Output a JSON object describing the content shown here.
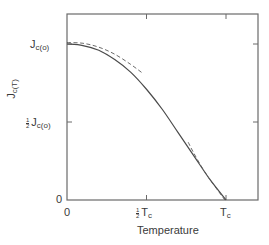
{
  "chart_data": {
    "type": "line",
    "title": "",
    "xlabel": "Temperature",
    "ylabel": "Jc(T)",
    "x_ticks": [
      {
        "label": "0",
        "value": 0
      },
      {
        "label": "½ Tc",
        "value": 0.5
      },
      {
        "label": "Tc",
        "value": 1.0
      }
    ],
    "y_ticks": [
      {
        "label": "0",
        "value": 0
      },
      {
        "label": "½ Jc(o)",
        "value": 0.5
      },
      {
        "label": "Jc(o)",
        "value": 1.0
      }
    ],
    "xlim": [
      0,
      1.2
    ],
    "ylim": [
      0,
      1.2
    ],
    "grid": false,
    "legend": null,
    "series": [
      {
        "name": "Jc(T) (solid)",
        "style": "solid",
        "x": [
          0.0,
          0.1,
          0.2,
          0.3,
          0.4,
          0.5,
          0.6,
          0.7,
          0.8,
          0.9,
          1.0
        ],
        "y": [
          1.0,
          0.99,
          0.96,
          0.9,
          0.82,
          0.71,
          0.58,
          0.43,
          0.28,
          0.13,
          0.0
        ]
      },
      {
        "name": "low-temperature approximation (dashed)",
        "style": "dashed",
        "x": [
          0.0,
          0.1,
          0.2,
          0.3,
          0.4,
          0.48
        ],
        "y": [
          1.0,
          0.995,
          0.97,
          0.925,
          0.86,
          0.8
        ]
      },
      {
        "name": "near-Tc approximation (dashed)",
        "style": "dashed",
        "x": [
          0.77,
          0.8,
          0.85,
          0.9,
          0.95,
          1.0
        ],
        "y": [
          0.37,
          0.31,
          0.22,
          0.14,
          0.07,
          0.0
        ]
      }
    ]
  },
  "labels": {
    "y_top": {
      "main": "J",
      "sub": "c(o)"
    },
    "y_half": {
      "num": "1",
      "den": "2",
      "main": "J",
      "sub": "c(o)"
    },
    "y_zero": "0",
    "x_zero": "0",
    "x_half": {
      "num": "1",
      "den": "2",
      "main": "T",
      "sub": "c"
    },
    "x_tc": {
      "main": "T",
      "sub": "c"
    },
    "xlabel": "Temperature",
    "ylabel": {
      "main": "J",
      "sub": "c(T)"
    }
  },
  "colors": {
    "axis": "#6a6a6a",
    "curve": "#4a4a4a",
    "dashed": "#5a5a5a",
    "text": "#3a3a3a"
  }
}
